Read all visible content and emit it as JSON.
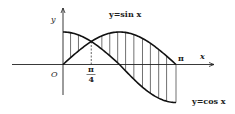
{
  "figure": {
    "type": "area-between-curves",
    "title": "",
    "axes": {
      "x_label": "x",
      "y_label": "y",
      "origin_label": "O",
      "x_ticks": [
        {
          "value": 0.7853981634,
          "label_num": "π",
          "label_den": "4",
          "dashed_guide": true
        },
        {
          "value": 3.1415926536,
          "label": "π"
        }
      ]
    },
    "curves": [
      {
        "name": "sin",
        "label": "y=sin x",
        "expr": "sin(x)",
        "domain": [
          0,
          3.1415926536
        ]
      },
      {
        "name": "cos",
        "label": "y=cos x",
        "expr": "cos(x)",
        "domain": [
          0,
          3.1415926536
        ]
      }
    ],
    "intersection": {
      "x": 0.7853981634,
      "label": "π/4"
    },
    "shaded_region": {
      "between": [
        "sin",
        "cos"
      ],
      "x_range": [
        0,
        3.1415926536
      ],
      "pattern": "vertical-hatch",
      "hatch_x_values": [
        0.21,
        0.43,
        1.08,
        1.3,
        1.52,
        1.74,
        1.97,
        2.21,
        2.43,
        2.66,
        2.88
      ]
    },
    "colors": {
      "stroke": "#222222",
      "background": "#ffffff"
    }
  }
}
